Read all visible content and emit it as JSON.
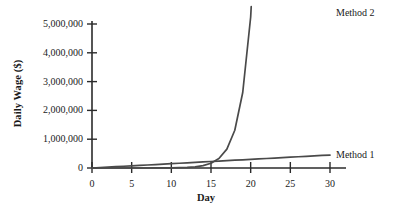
{
  "chart_data": {
    "type": "line",
    "title": "",
    "subtitle": "",
    "xlabel": "Day",
    "ylabel": "Daily Wage ($)",
    "xlim": [
      0,
      31.5
    ],
    "ylim": [
      0,
      5600000
    ],
    "grid": false,
    "legend_position": "inline-right",
    "x_ticks": [
      {
        "value": 0,
        "label": "0"
      },
      {
        "value": 5,
        "label": "5"
      },
      {
        "value": 10,
        "label": "10"
      },
      {
        "value": 15,
        "label": "15"
      },
      {
        "value": 20,
        "label": "20"
      },
      {
        "value": 25,
        "label": "25"
      },
      {
        "value": 30,
        "label": "30"
      }
    ],
    "y_ticks": [
      {
        "value": 0,
        "label": "0"
      },
      {
        "value": 1000000,
        "label": "1,000,000"
      },
      {
        "value": 2000000,
        "label": "2,000,000"
      },
      {
        "value": 3000000,
        "label": "3,000,000"
      },
      {
        "value": 4000000,
        "label": "4,000,000"
      },
      {
        "value": 5000000,
        "label": "5,000,000"
      }
    ],
    "x": [
      0,
      1,
      2,
      3,
      4,
      5,
      6,
      7,
      8,
      9,
      10,
      11,
      12,
      13,
      14,
      15,
      16,
      17,
      18,
      19,
      20,
      21,
      22,
      23,
      24,
      25,
      26,
      27,
      28,
      29,
      30
    ],
    "series": [
      {
        "name": "Method 1",
        "label": "Method 1",
        "color": "#4a4a4a",
        "description": "linear growth, 15,000 per day",
        "values": [
          0,
          15000,
          30000,
          45000,
          60000,
          75000,
          90000,
          105000,
          120000,
          135000,
          150000,
          165000,
          180000,
          195000,
          210000,
          225000,
          240000,
          255000,
          270000,
          285000,
          300000,
          315000,
          330000,
          345000,
          360000,
          375000,
          390000,
          405000,
          420000,
          435000,
          450000
        ]
      },
      {
        "name": "Method 2",
        "label": "Method 2",
        "color": "#4a4a4a",
        "description": "exponential doubling from 0.01, value = 0.01 * 2^(day-1)",
        "values": [
          0,
          10,
          20,
          40,
          80,
          160,
          320,
          640,
          1280,
          2560,
          5120,
          10240,
          20480,
          40960,
          81920,
          163840,
          327680,
          655360,
          1310720,
          2621440,
          5242880,
          10485760,
          20971520,
          41943040,
          83886080,
          167772160,
          335544320,
          671088640,
          1342177280,
          2684354560,
          5368709120
        ]
      }
    ],
    "annotations": [
      {
        "name": "method-2-endpoint",
        "text": "Method 2",
        "x": 30,
        "y": 5368709
      },
      {
        "name": "method-1-endpoint",
        "text": "Method 1",
        "x": 30,
        "y": 450000
      }
    ],
    "crossover_note": "Method 2 overtakes Method 1 just after day 25"
  },
  "colors": {
    "axis": "#2b2b2b",
    "line": "#4a4a4a",
    "background": "#ffffff",
    "text": "#1a1a1a"
  }
}
